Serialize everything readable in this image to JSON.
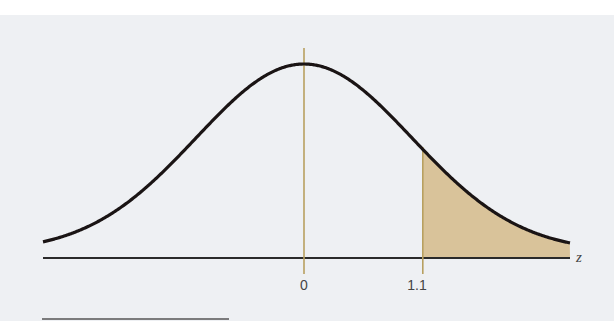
{
  "chart_data": {
    "type": "area",
    "title": "",
    "xlabel": "z",
    "ylabel": "",
    "x_ticks": [
      {
        "value": 0,
        "label": "0"
      },
      {
        "value": 1.1,
        "label": "1.1"
      }
    ],
    "xlim": [
      -2.45,
      2.45
    ],
    "distribution": {
      "name": "standard normal",
      "mean": 0,
      "sd": 1
    },
    "shaded_region": {
      "from": 1.1,
      "to": 2.45,
      "side": "right"
    },
    "grid": false,
    "legend": false
  },
  "labels": {
    "axis_var": "z",
    "tick_0": "0",
    "tick_1": "1.1"
  },
  "colors": {
    "curve": "#1a1414",
    "axis": "#2a2a2a",
    "marker_lines": "#b8a060",
    "shade": "#d9c39a",
    "panel": "#eef0f3"
  }
}
